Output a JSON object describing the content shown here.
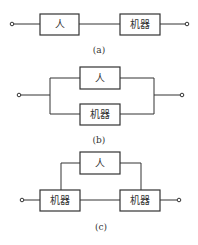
{
  "diagrams": [
    {
      "caption": "(a)",
      "type": "series",
      "blocks": [
        {
          "label": "人"
        },
        {
          "label": "机器"
        }
      ]
    },
    {
      "caption": "(b)",
      "type": "parallel",
      "blocks": [
        {
          "label": "人"
        },
        {
          "label": "机器"
        }
      ]
    },
    {
      "caption": "(c)",
      "type": "series-parallel",
      "blocks": [
        {
          "label": "人"
        },
        {
          "label": "机器"
        },
        {
          "label": "机器"
        }
      ]
    }
  ]
}
